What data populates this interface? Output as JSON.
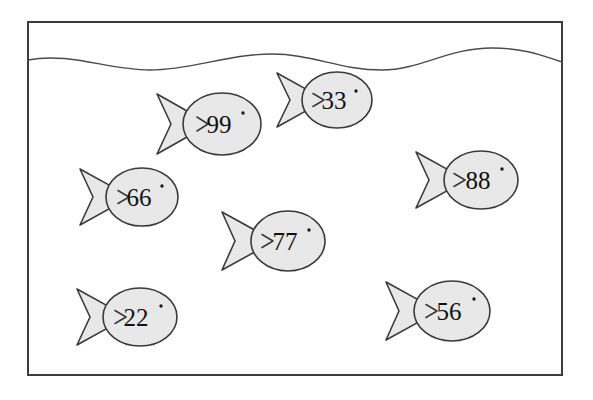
{
  "scene": {
    "title": "Fish tank with numbered fish",
    "background_color": "#ffffff",
    "frame": {
      "name": "tank-frame",
      "x": 28,
      "y": 22,
      "width": 534,
      "height": 353,
      "stroke_color": "#3c3c3c",
      "stroke_width": 2,
      "fill_color": "#ffffff"
    },
    "water_surface": {
      "name": "water-surface-line",
      "label": "water surface",
      "stroke_color": "#4a4a4a",
      "stroke_width": 1.4,
      "path": "M28,60 C70,52 108,70 150,70 C192,70 228,54 272,54 C312,54 340,70 382,70 C420,70 448,48 492,48 C528,48 548,58 562,62"
    },
    "fish_style": {
      "body_fill": "#e8e8e8",
      "body_stroke": "#3a3a3a",
      "body_stroke_width": 1.6,
      "eye_fill": "#1a1a1a",
      "number_color": "#111111",
      "number_font_size": 25
    },
    "fish": [
      {
        "name": "fish-99",
        "label": "99",
        "cx": 222,
        "cy": 124,
        "rx": 39,
        "ry": 31,
        "tail_tip_x": 157,
        "tail_width": 42,
        "tail_half_height": 30,
        "tail_notch": 14,
        "eye_x": 243,
        "eye_y": 113,
        "eye_r": 1.7,
        "text_x": 219,
        "text_y": 127
      },
      {
        "name": "fish-33",
        "label": "33",
        "cx": 337,
        "cy": 100,
        "rx": 35,
        "ry": 28,
        "tail_tip_x": 277,
        "tail_width": 38,
        "tail_half_height": 27,
        "tail_notch": 13,
        "eye_x": 356,
        "eye_y": 91,
        "eye_r": 1.7,
        "text_x": 334,
        "text_y": 103
      },
      {
        "name": "fish-66",
        "label": "66",
        "cx": 142,
        "cy": 197,
        "rx": 36,
        "ry": 29,
        "tail_tip_x": 80,
        "tail_width": 40,
        "tail_half_height": 28,
        "tail_notch": 13,
        "eye_x": 162,
        "eye_y": 186,
        "eye_r": 1.7,
        "text_x": 139,
        "text_y": 200
      },
      {
        "name": "fish-88",
        "label": "88",
        "cx": 481,
        "cy": 180,
        "rx": 37,
        "ry": 29,
        "tail_tip_x": 416,
        "tail_width": 40,
        "tail_half_height": 28,
        "tail_notch": 13,
        "eye_x": 502,
        "eye_y": 169,
        "eye_r": 1.7,
        "text_x": 478,
        "text_y": 183
      },
      {
        "name": "fish-77",
        "label": "77",
        "cx": 288,
        "cy": 241,
        "rx": 37,
        "ry": 30,
        "tail_tip_x": 222,
        "tail_width": 42,
        "tail_half_height": 29,
        "tail_notch": 13,
        "eye_x": 309,
        "eye_y": 230,
        "eye_r": 1.7,
        "text_x": 285,
        "text_y": 244
      },
      {
        "name": "fish-22",
        "label": "22",
        "cx": 140,
        "cy": 317,
        "rx": 37,
        "ry": 29,
        "tail_tip_x": 77,
        "tail_width": 40,
        "tail_half_height": 28,
        "tail_notch": 13,
        "eye_x": 161,
        "eye_y": 306,
        "eye_r": 1.7,
        "text_x": 136,
        "text_y": 320
      },
      {
        "name": "fish-56",
        "label": "56",
        "cx": 452,
        "cy": 311,
        "rx": 38,
        "ry": 30,
        "tail_tip_x": 386,
        "tail_width": 42,
        "tail_half_height": 29,
        "tail_notch": 13,
        "eye_x": 474,
        "eye_y": 299,
        "eye_r": 1.7,
        "text_x": 449,
        "text_y": 314
      }
    ]
  }
}
